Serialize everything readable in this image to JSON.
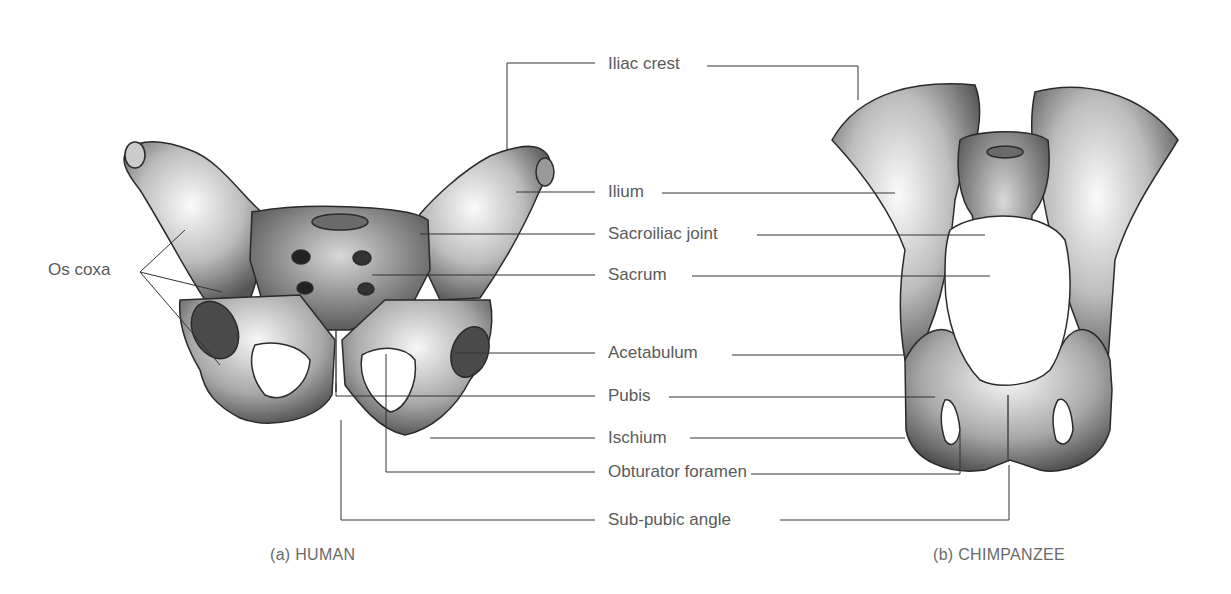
{
  "figure": {
    "panels": [
      {
        "id": "human",
        "caption": "(a) HUMAN"
      },
      {
        "id": "chimpanzee",
        "caption": "(b) CHIMPANZEE"
      }
    ],
    "labels": {
      "os_coxa": "Os coxa",
      "iliac_crest": "Iliac crest",
      "ilium": "Ilium",
      "sacroiliac_joint": "Sacroiliac joint",
      "sacrum": "Sacrum",
      "acetabulum": "Acetabulum",
      "pubis": "Pubis",
      "ischium": "Ischium",
      "obturator_foramen": "Obturator foramen",
      "sub_pubic_angle": "Sub-pubic angle"
    },
    "colors": {
      "line": "#333333",
      "text": "#5a5a5a",
      "bone_light": "#f2f2f2",
      "bone_mid": "#9a9a9a",
      "bone_dark": "#3a3a3a"
    }
  }
}
